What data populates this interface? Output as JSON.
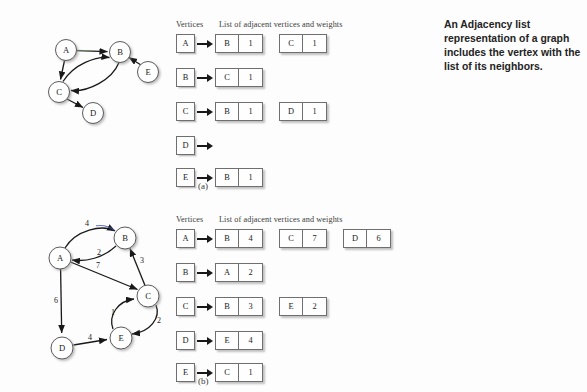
{
  "sidenote": {
    "text": "An Adjacency list representation of a graph includes the vertex with the list of its neighbors."
  },
  "panel_a": {
    "caption": "(a)",
    "table": {
      "header_vertices": "Vertices",
      "header_list": "List of adjacent vertices and weights",
      "rows": [
        {
          "vertex": "A",
          "cells": [
            {
              "v": "B",
              "w": "1"
            },
            {
              "v": "C",
              "w": "1"
            }
          ]
        },
        {
          "vertex": "B",
          "cells": [
            {
              "v": "C",
              "w": "1"
            }
          ]
        },
        {
          "vertex": "C",
          "cells": [
            {
              "v": "B",
              "w": "1"
            },
            {
              "v": "D",
              "w": "1"
            }
          ]
        },
        {
          "vertex": "D",
          "cells": []
        },
        {
          "vertex": "E",
          "cells": [
            {
              "v": "B",
              "w": "1"
            }
          ]
        }
      ]
    },
    "graph": {
      "nodes": [
        {
          "id": "A",
          "label": "A",
          "cx": 66,
          "cy": 50,
          "r": 10.5
        },
        {
          "id": "B",
          "label": "B",
          "cx": 120,
          "cy": 52,
          "r": 10.5
        },
        {
          "id": "C",
          "label": "C",
          "cx": 59,
          "cy": 92,
          "r": 10.5
        },
        {
          "id": "D",
          "label": "D",
          "cx": 93,
          "cy": 113,
          "r": 10.5
        },
        {
          "id": "E",
          "label": "E",
          "cx": 148,
          "cy": 72,
          "r": 10.5
        }
      ],
      "edges": [
        {
          "from": "A",
          "to": "B",
          "weight": ""
        },
        {
          "from": "A",
          "to": "C",
          "weight": ""
        },
        {
          "from": "C",
          "to": "B",
          "weight": ""
        },
        {
          "from": "B",
          "to": "C",
          "weight": ""
        },
        {
          "from": "C",
          "to": "D",
          "weight": ""
        },
        {
          "from": "E",
          "to": "B",
          "weight": ""
        }
      ]
    }
  },
  "panel_b": {
    "caption": "(b)",
    "table": {
      "header_vertices": "Vertices",
      "header_list": "List of adjacent vertices and weights",
      "rows": [
        {
          "vertex": "A",
          "cells": [
            {
              "v": "B",
              "w": "4"
            },
            {
              "v": "C",
              "w": "7"
            },
            {
              "v": "D",
              "w": "6"
            }
          ]
        },
        {
          "vertex": "B",
          "cells": [
            {
              "v": "A",
              "w": "2"
            }
          ]
        },
        {
          "vertex": "C",
          "cells": [
            {
              "v": "B",
              "w": "3"
            },
            {
              "v": "E",
              "w": "2"
            }
          ]
        },
        {
          "vertex": "D",
          "cells": [
            {
              "v": "E",
              "w": "4"
            }
          ]
        },
        {
          "vertex": "E",
          "cells": [
            {
              "v": "C",
              "w": "1"
            }
          ]
        }
      ]
    },
    "graph": {
      "nodes": [
        {
          "id": "A",
          "label": "A",
          "cx": 60,
          "cy": 258,
          "r": 11
        },
        {
          "id": "B",
          "label": "B",
          "cx": 125,
          "cy": 238,
          "r": 11
        },
        {
          "id": "C",
          "label": "C",
          "cx": 148,
          "cy": 296,
          "r": 11
        },
        {
          "id": "D",
          "label": "D",
          "cx": 62,
          "cy": 348,
          "r": 11
        },
        {
          "id": "E",
          "label": "E",
          "cx": 121,
          "cy": 338,
          "r": 11
        }
      ],
      "edges": [
        {
          "from": "A",
          "to": "B",
          "weight": "4"
        },
        {
          "from": "B",
          "to": "A",
          "weight": "2"
        },
        {
          "from": "A",
          "to": "C",
          "weight": "7"
        },
        {
          "from": "B",
          "to": "C",
          "weight": "3"
        },
        {
          "from": "A",
          "to": "D",
          "weight": "6"
        },
        {
          "from": "D",
          "to": "E",
          "weight": "4"
        },
        {
          "from": "E",
          "to": "C",
          "weight": "1"
        },
        {
          "from": "C",
          "to": "E",
          "weight": "2"
        }
      ]
    }
  },
  "colors": {
    "background": "#fdfdfd",
    "stroke": "#191919",
    "box_border": "#6f6f6f",
    "text": "#232323"
  }
}
